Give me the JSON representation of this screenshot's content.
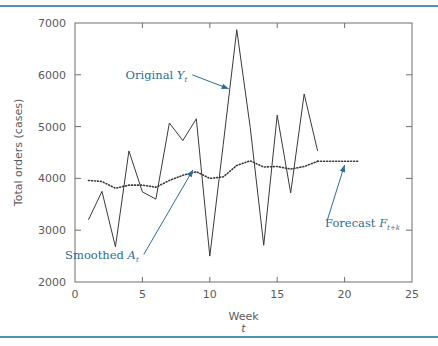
{
  "figure": {
    "background_color": "#ffffff",
    "rule_color": "#4b93b0",
    "axis_color": "#6e6e6e",
    "series_color": "#3a3a3a",
    "annotation_color": "#2c6d92"
  },
  "chart_data": {
    "type": "line",
    "title": "",
    "xlabel": "Week",
    "xlabel_sub": "t",
    "ylabel": "Total orders (cases)",
    "xlim": [
      0,
      25
    ],
    "ylim": [
      2000,
      7000
    ],
    "xticks": [
      0,
      5,
      10,
      15,
      20,
      25
    ],
    "xtick_labels": [
      "0",
      "5",
      "10",
      "15",
      "20",
      "25"
    ],
    "yticks": [
      2000,
      3000,
      4000,
      5000,
      6000,
      7000
    ],
    "ytick_labels": [
      "2000",
      "3000",
      "4000",
      "5000",
      "6000",
      "7000"
    ],
    "grid": false,
    "legend_position": "annotations",
    "series": [
      {
        "name": "Original Y_t",
        "style": "solid",
        "x": [
          1,
          2,
          3,
          4,
          5,
          6,
          7,
          8,
          9,
          10,
          11,
          12,
          13,
          14,
          15,
          16,
          17,
          18
        ],
        "values": [
          3200,
          3750,
          2680,
          4530,
          3740,
          3600,
          5070,
          4730,
          5150,
          2500,
          4660,
          6870,
          4980,
          2710,
          5220,
          3720,
          5630,
          4530
        ]
      },
      {
        "name": "Smoothed A_t",
        "style": "dotted",
        "x": [
          1,
          2,
          3,
          4,
          5,
          6,
          7,
          8,
          9,
          10,
          11,
          12,
          13,
          14,
          15,
          16,
          17,
          18
        ],
        "values": [
          3960,
          3940,
          3810,
          3870,
          3870,
          3830,
          3960,
          4060,
          4130,
          4000,
          4030,
          4250,
          4340,
          4220,
          4230,
          4180,
          4230,
          4330
        ]
      },
      {
        "name": "Forecast F_t+k",
        "style": "dotted",
        "x": [
          18,
          21
        ],
        "values": [
          4330,
          4330
        ]
      }
    ],
    "annotations": [
      {
        "id": "original",
        "text": "Original",
        "symbol": "Y",
        "subscript": "t",
        "arrow_from": [
          8.7,
          6000
        ],
        "arrow_to": [
          11.4,
          5730
        ]
      },
      {
        "id": "smoothed",
        "text": "Smoothed",
        "symbol": "A",
        "subscript": "t",
        "arrow_from": [
          5.1,
          2530
        ],
        "arrow_to": [
          8.75,
          4165
        ]
      },
      {
        "id": "forecast",
        "text": "Forecast",
        "symbol": "F",
        "subscript": "t+k",
        "arrow_from": [
          18.7,
          3180
        ],
        "arrow_to": [
          20.0,
          4260
        ]
      }
    ]
  }
}
